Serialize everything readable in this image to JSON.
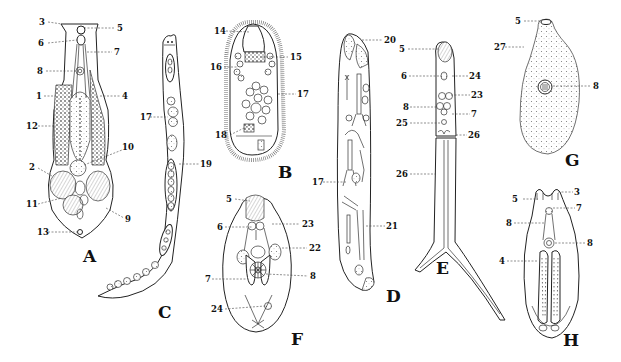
{
  "plate": {
    "type": "scientific-illustration",
    "background": "#ffffff",
    "ink": "#222222"
  },
  "figures": {
    "A": {
      "letter": "A",
      "labels": [
        "1",
        "2",
        "3",
        "4",
        "5",
        "6",
        "7",
        "8",
        "9",
        "10",
        "11",
        "12",
        "13"
      ]
    },
    "B": {
      "letter": "B",
      "labels": [
        "14",
        "15",
        "16",
        "17",
        "18"
      ]
    },
    "C": {
      "letter": "C",
      "labels": [
        "17",
        "19"
      ]
    },
    "D": {
      "letter": "D",
      "labels": [
        "17",
        "20",
        "21"
      ]
    },
    "E": {
      "letter": "E",
      "labels": [
        "5",
        "6",
        "7",
        "8",
        "22",
        "23",
        "24",
        "25",
        "26"
      ]
    },
    "F": {
      "letter": "F",
      "labels": [
        "5",
        "6",
        "7",
        "8",
        "22",
        "23",
        "24"
      ]
    },
    "G": {
      "letter": "G",
      "labels": [
        "5",
        "8",
        "27"
      ]
    },
    "H": {
      "letter": "H",
      "labels": [
        "3",
        "4",
        "5",
        "6",
        "7",
        "8"
      ]
    }
  }
}
